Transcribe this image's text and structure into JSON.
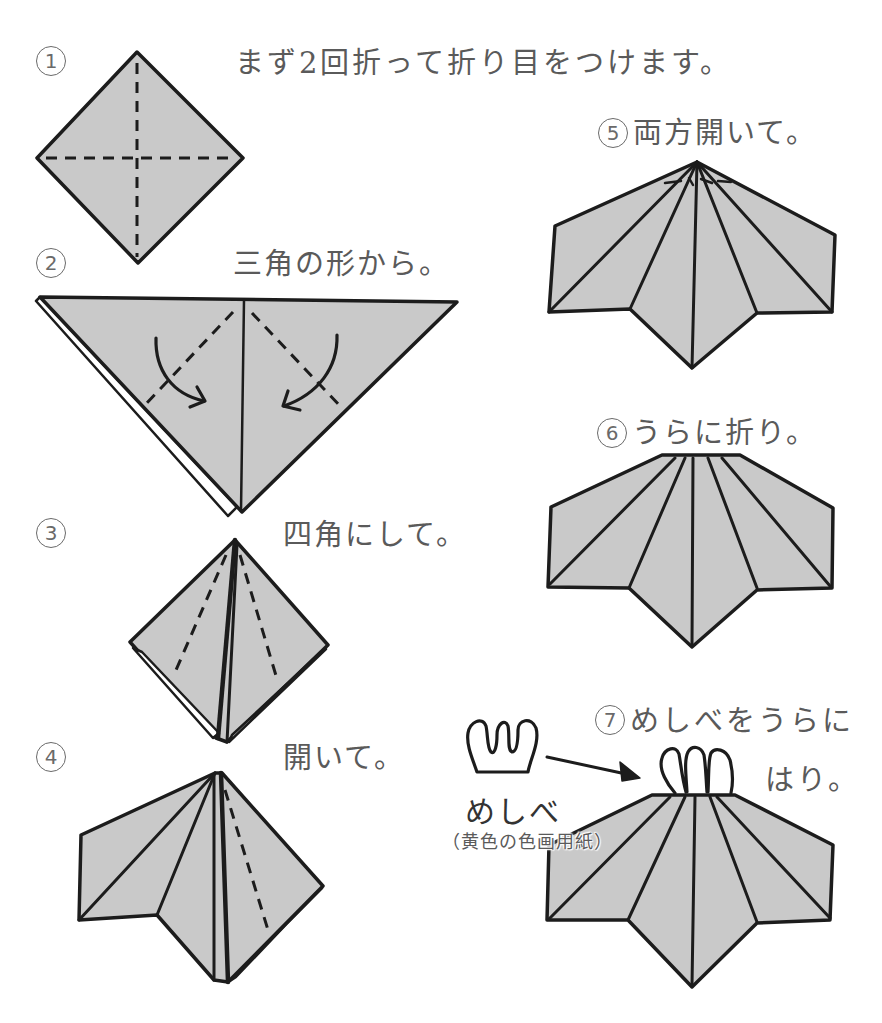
{
  "colors": {
    "background": "#ffffff",
    "paper_fill": "#c9c9c9",
    "outline": "#1c1c1c",
    "caption_text": "#5a5a5a"
  },
  "steps": [
    {
      "marker": "1",
      "caption": "まず2回折って折り目をつけます。"
    },
    {
      "marker": "2",
      "caption": "三角の形から。"
    },
    {
      "marker": "3",
      "caption": "四角にして。"
    },
    {
      "marker": "4",
      "caption": "開いて。"
    },
    {
      "marker": "5",
      "caption": "両方開いて。"
    },
    {
      "marker": "6",
      "caption": "うらに折り。"
    },
    {
      "marker": "7",
      "caption": "めしべをうらに",
      "caption_cont": "はり。"
    }
  ],
  "pistil": {
    "label": "めしべ",
    "material_note": "（黄色の色画用紙）"
  },
  "icons": {
    "crease": "dashed-crease-line",
    "fold_direction": "curved-fold-arrow-icon",
    "attach": "attach-arrow-icon"
  }
}
